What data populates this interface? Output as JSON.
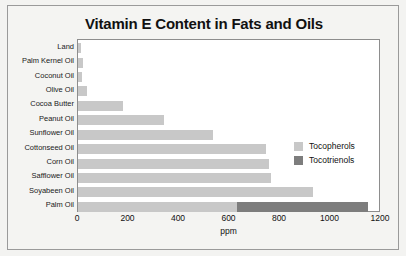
{
  "chart_data": {
    "type": "bar",
    "orientation": "horizontal",
    "stacked": true,
    "title": "Vitamin E Content in Fats and Oils",
    "xlabel": "ppm",
    "ylabel": "",
    "xlim": [
      0,
      1200
    ],
    "xticks": [
      0,
      200,
      400,
      600,
      800,
      1000,
      1200
    ],
    "xtick_labels": [
      "0",
      "200",
      "400",
      "600",
      "800",
      "1000",
      "1200"
    ],
    "grid": false,
    "legend_position": "center-right",
    "categories": [
      "Land",
      "Palm Kernel Oil",
      "Coconut Oil",
      "Olive Oil",
      "Cocoa Butter",
      "Peanut Oil",
      "Sunflower Oil",
      "Cottonseed Oil",
      "Corn  Oil",
      "Safflower Oil",
      "Soyabeen Oil",
      "Palm Oil"
    ],
    "series": [
      {
        "name": "Tocopherols",
        "color": "#c8c8c8",
        "values": [
          12,
          18,
          15,
          35,
          180,
          340,
          535,
          745,
          755,
          765,
          930,
          630
        ]
      },
      {
        "name": "Tocotrienols",
        "color": "#7d7d7d",
        "values": [
          0,
          0,
          0,
          0,
          0,
          0,
          0,
          0,
          0,
          0,
          0,
          520
        ]
      }
    ],
    "legend": [
      {
        "label": "Tocopherols",
        "color": "#c8c8c8"
      },
      {
        "label": "Tocotrienols",
        "color": "#7d7d7d"
      }
    ]
  }
}
